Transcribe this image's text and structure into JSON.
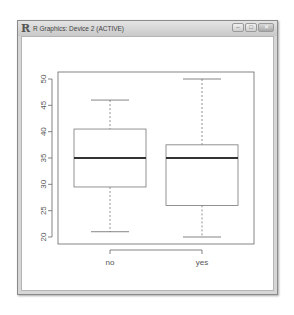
{
  "window": {
    "title": "R Graphics: Device 2 (ACTIVE)",
    "logo": "R",
    "buttons": {
      "minimize": "–",
      "maximize": "□",
      "close": "✕"
    }
  },
  "chart_data": {
    "type": "boxplot",
    "title": "",
    "xlabel": "",
    "ylabel": "",
    "categories": [
      "no",
      "yes"
    ],
    "ylim": [
      19,
      51
    ],
    "yticks": [
      20,
      25,
      30,
      35,
      40,
      45,
      50
    ],
    "ytick_labels": [
      "20",
      "25",
      "30",
      "35",
      "40",
      "45",
      "50"
    ],
    "grid": false,
    "legend": null,
    "series": [
      {
        "name": "no",
        "min": 21,
        "q1": 29.5,
        "median": 35,
        "q3": 40.5,
        "max": 46
      },
      {
        "name": "yes",
        "min": 20,
        "q1": 26,
        "median": 35,
        "q3": 37.5,
        "max": 50
      }
    ]
  }
}
